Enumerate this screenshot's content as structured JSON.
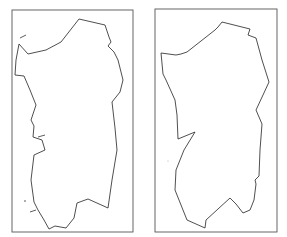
{
  "panels": [
    {
      "id": "left",
      "frame": {
        "x": 12,
        "y": 10,
        "w": 121,
        "h": 222
      },
      "outline": [
        [
          79,
          19
        ],
        [
          105,
          25
        ],
        [
          109,
          37
        ],
        [
          111,
          42
        ],
        [
          108,
          46
        ],
        [
          114,
          52
        ],
        [
          118,
          60
        ],
        [
          123,
          80
        ],
        [
          120,
          92
        ],
        [
          112,
          102
        ],
        [
          115,
          128
        ],
        [
          117,
          150
        ],
        [
          112,
          180
        ],
        [
          108,
          208
        ],
        [
          88,
          199
        ],
        [
          77,
          203
        ],
        [
          74,
          218
        ],
        [
          66,
          228
        ],
        [
          55,
          226
        ],
        [
          49,
          229
        ],
        [
          44,
          220
        ],
        [
          38,
          210
        ],
        [
          34,
          202
        ],
        [
          31,
          180
        ],
        [
          34,
          155
        ],
        [
          45,
          150
        ],
        [
          42,
          140
        ],
        [
          33,
          137
        ],
        [
          34,
          126
        ],
        [
          31,
          120
        ],
        [
          36,
          105
        ],
        [
          30,
          90
        ],
        [
          24,
          76
        ],
        [
          15,
          75
        ],
        [
          16,
          60
        ],
        [
          19,
          44
        ],
        [
          28,
          54
        ],
        [
          46,
          50
        ],
        [
          61,
          42
        ],
        [
          79,
          19
        ]
      ],
      "islets": [
        [
          [
            20,
            38
          ],
          [
            26,
            35
          ]
        ],
        [
          [
            38,
            137
          ],
          [
            45,
            135
          ]
        ],
        [
          [
            30,
            212
          ],
          [
            36,
            210
          ]
        ],
        [
          [
            24,
            201
          ],
          [
            26,
            201
          ]
        ]
      ]
    },
    {
      "id": "right",
      "frame": {
        "x": 155,
        "y": 9,
        "w": 122,
        "h": 223
      },
      "outline": [
        [
          222,
          22
        ],
        [
          250,
          29
        ],
        [
          248,
          35
        ],
        [
          256,
          38
        ],
        [
          262,
          60
        ],
        [
          269,
          82
        ],
        [
          263,
          95
        ],
        [
          256,
          110
        ],
        [
          262,
          124
        ],
        [
          260,
          150
        ],
        [
          259,
          176
        ],
        [
          255,
          180
        ],
        [
          256,
          184
        ],
        [
          254,
          200
        ],
        [
          250,
          210
        ],
        [
          243,
          213
        ],
        [
          236,
          204
        ],
        [
          230,
          198
        ],
        [
          206,
          220
        ],
        [
          205,
          228
        ],
        [
          187,
          220
        ],
        [
          175,
          190
        ],
        [
          176,
          170
        ],
        [
          184,
          150
        ],
        [
          195,
          132
        ],
        [
          178,
          139
        ],
        [
          177,
          115
        ],
        [
          175,
          100
        ],
        [
          166,
          80
        ],
        [
          163,
          74
        ],
        [
          161,
          53
        ],
        [
          176,
          55
        ],
        [
          181,
          54
        ],
        [
          187,
          52
        ],
        [
          215,
          30
        ],
        [
          218,
          27
        ],
        [
          222,
          22
        ]
      ],
      "islets": [],
      "dots": [
        [
          168,
          161
        ]
      ]
    }
  ]
}
